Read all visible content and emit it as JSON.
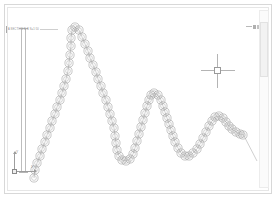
{
  "app": {
    "title": "CAD Drawing Viewport",
    "background_color": "#ffffff",
    "line_color": "#9a9a9a",
    "border_color": "#d8d8d8"
  },
  "sheet": {
    "outer_border_label": "drawing-sheet-border",
    "inner_border_label": "drawing-sheet-inner-border"
  },
  "annotation": {
    "label": "A  SECTION  B-B  S=1:50",
    "icon": "dimension-tick-icon"
  },
  "section_line": {
    "name": "vertical-section-line",
    "cap_top": "section-line-cap-top",
    "cap_bottom": "section-line-cap-bottom"
  },
  "ucs": {
    "name": "ucs-axis-icon",
    "y_label": "Y",
    "x_label": "X",
    "origin_marker": "ucs-origin-square"
  },
  "crosshair": {
    "name": "crosshair-cursor",
    "center_x": 218,
    "center_y": 71,
    "pick_box": "crosshair-pick-box"
  },
  "top_right_marker": {
    "name": "view-marker",
    "label": "— ■■"
  },
  "scrollbar": {
    "name": "vertical-scrollbar",
    "thumb_name": "scrollbar-thumb",
    "position_percent": 7
  },
  "chart_data": {
    "type": "line",
    "xlabel": "",
    "ylabel": "",
    "xlim": [
      30,
      258
    ],
    "ylim": [
      20,
      180
    ],
    "grid": false,
    "legend": null,
    "marker": "double-circle",
    "marker_radius_outer": 4.1,
    "marker_radius_inner": 2.4,
    "marker_color": "#9a9a9a",
    "line_color": "#a8a8a8",
    "tail_segment": {
      "x1": 243,
      "y1": 134,
      "x2": 257,
      "y2": 161
    },
    "peaks": [
      {
        "x": 72,
        "y": 28,
        "label": "peak-1"
      },
      {
        "x": 152,
        "y": 92,
        "label": "peak-2"
      },
      {
        "x": 216,
        "y": 115,
        "label": "peak-3"
      }
    ],
    "valleys": [
      {
        "x": 115,
        "y": 160,
        "label": "valley-1"
      },
      {
        "x": 185,
        "y": 155,
        "label": "valley-2"
      }
    ],
    "points": [
      [
        34,
        178
      ],
      [
        35,
        170
      ],
      [
        37,
        163
      ],
      [
        40,
        156
      ],
      [
        42,
        149
      ],
      [
        45,
        142
      ],
      [
        47,
        135
      ],
      [
        50,
        128
      ],
      [
        52,
        121
      ],
      [
        55,
        114
      ],
      [
        57,
        107
      ],
      [
        60,
        100
      ],
      [
        62,
        93
      ],
      [
        64,
        86
      ],
      [
        66,
        79
      ],
      [
        68,
        71
      ],
      [
        69,
        63
      ],
      [
        70,
        55
      ],
      [
        71,
        46
      ],
      [
        71,
        38
      ],
      [
        72,
        30
      ],
      [
        75,
        27
      ],
      [
        79,
        30
      ],
      [
        82,
        37
      ],
      [
        85,
        44
      ],
      [
        88,
        51
      ],
      [
        90,
        58
      ],
      [
        93,
        65
      ],
      [
        96,
        72
      ],
      [
        98,
        79
      ],
      [
        101,
        86
      ],
      [
        103,
        93
      ],
      [
        106,
        100
      ],
      [
        108,
        107
      ],
      [
        110,
        114
      ],
      [
        112,
        121
      ],
      [
        114,
        128
      ],
      [
        115,
        136
      ],
      [
        116,
        143
      ],
      [
        117,
        150
      ],
      [
        119,
        156
      ],
      [
        122,
        160
      ],
      [
        126,
        161
      ],
      [
        130,
        159
      ],
      [
        133,
        154
      ],
      [
        135,
        148
      ],
      [
        137,
        141
      ],
      [
        139,
        134
      ],
      [
        141,
        127
      ],
      [
        143,
        120
      ],
      [
        145,
        113
      ],
      [
        147,
        106
      ],
      [
        149,
        100
      ],
      [
        151,
        95
      ],
      [
        154,
        93
      ],
      [
        158,
        95
      ],
      [
        161,
        100
      ],
      [
        163,
        106
      ],
      [
        165,
        112
      ],
      [
        167,
        118
      ],
      [
        169,
        124
      ],
      [
        171,
        130
      ],
      [
        173,
        136
      ],
      [
        175,
        142
      ],
      [
        178,
        148
      ],
      [
        181,
        153
      ],
      [
        185,
        156
      ],
      [
        189,
        156
      ],
      [
        193,
        153
      ],
      [
        197,
        149
      ],
      [
        200,
        144
      ],
      [
        203,
        138
      ],
      [
        206,
        132
      ],
      [
        209,
        126
      ],
      [
        212,
        121
      ],
      [
        215,
        117
      ],
      [
        219,
        116
      ],
      [
        223,
        118
      ],
      [
        226,
        122
      ],
      [
        229,
        126
      ],
      [
        232,
        129
      ],
      [
        236,
        132
      ],
      [
        240,
        134
      ],
      [
        243,
        135
      ]
    ]
  }
}
